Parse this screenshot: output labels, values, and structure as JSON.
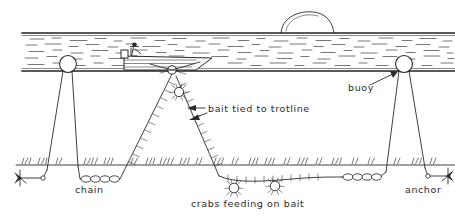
{
  "figure": {
    "style": "pen-and-ink line drawing",
    "ink_color": "#2b2b2b",
    "background_color": "#ffffff"
  },
  "labels": {
    "bait": "bait tied to trotline",
    "buoy": "buoy",
    "chain": "chain",
    "anchor": "anchor",
    "crabs": "crabs feeding on bait"
  },
  "scene": {
    "water_surface_label": "water surface",
    "seabed_label": "seabed",
    "horizon_feature": "distant hill on horizon",
    "vessel": "small fishing boat with standing fisherman",
    "buoy_count": 2,
    "crab_count": 3,
    "anchor_count": 2,
    "chain_segment_count": 2
  },
  "geometry": {
    "width": 455,
    "height": 219,
    "water_top_y": 33,
    "water_bottom_y": 71,
    "seabed_y": 165,
    "left_buoy_x": 68,
    "right_buoy_x": 404,
    "boat_x": 150,
    "trotline_apex_x": 172
  }
}
